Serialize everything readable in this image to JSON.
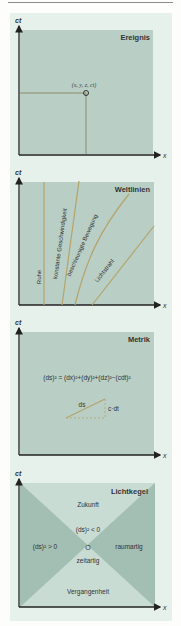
{
  "colors": {
    "figure_bg": "#e6f1ec",
    "panel_fill": "#b9cfc6",
    "panel_fill_dark": "#9fbcb0",
    "panel_fill_light": "#c9dcd4",
    "axis": "#222222",
    "worldline": "#b5a36a",
    "text": "#333333"
  },
  "axes": {
    "y_label": "ct",
    "x_label": "x"
  },
  "panels": [
    {
      "title": "Ereignis",
      "event_label": "(x, y, z, ct)"
    },
    {
      "title": "Weltlinien",
      "lines": [
        {
          "label": "Ruhe"
        },
        {
          "label": "konstante Geschwindigkeit"
        },
        {
          "label": "beschleunigte Bewegung"
        },
        {
          "label": "Lichtstrahl"
        }
      ]
    },
    {
      "title": "Metrik",
      "formula": "(ds)² = (dx)²+(dy)²+(dz)²−(cdt)²",
      "hyp_label": "ds",
      "leg_label": "c·dt"
    },
    {
      "title": "Lichtkegel",
      "future": "Zukunft",
      "past": "Vergangenheit",
      "timelike_cond": "(ds)² < 0",
      "timelike": "zeitartig",
      "spacelike_cond": "(ds)² > 0",
      "spacelike": "raumartig",
      "origin": "O"
    }
  ]
}
